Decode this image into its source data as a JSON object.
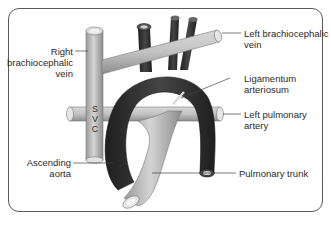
{
  "diagram": {
    "type": "anatomical",
    "colors": {
      "vein": "#b8b8b8",
      "artery_dark": "#2e2e2e",
      "pulmonary": "#bdbdbd",
      "frame": "#5a5a5a",
      "leader_line": "#444444",
      "text": "#2a2a2a"
    },
    "labels": {
      "right_brachiocephalic_vein": "Right\nbrachiocephalic\nvein",
      "left_brachiocephalic_vein": "Left brachiocephalic\nvein",
      "ligamentum_arteriosum": "Ligamentum\narteriosum",
      "left_pulmonary_artery": "Left pulmonary\nartery",
      "ascending_aorta": "Ascending\naorta",
      "pulmonary_trunk": "Pulmonary trunk",
      "svc_s": "S",
      "svc_v": "V",
      "svc_c": "C"
    }
  }
}
